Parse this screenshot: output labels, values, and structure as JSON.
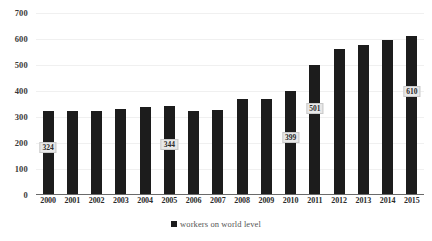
{
  "chart_data": {
    "type": "bar",
    "title": "",
    "subtitle": "",
    "xlabel": "",
    "ylabel": "",
    "categories": [
      "2000",
      "2001",
      "2002",
      "2003",
      "2004",
      "2005",
      "2006",
      "2007",
      "2008",
      "2009",
      "2010",
      "2011",
      "2012",
      "2013",
      "2014",
      "2015"
    ],
    "values": [
      324,
      323,
      323,
      330,
      338,
      344,
      323,
      327,
      370,
      368,
      399,
      501,
      560,
      578,
      598,
      610
    ],
    "point_labels": {
      "2000": "324",
      "2005": "344",
      "2010": "399",
      "2011": "501",
      "2015": "610"
    },
    "ylim": [
      0,
      700
    ],
    "yticks": [
      "0",
      "100",
      "200",
      "300",
      "400",
      "500",
      "600",
      "700"
    ],
    "grid": true,
    "legend": {
      "position": "bottom",
      "entries": [
        {
          "label": "workers on world level",
          "color": "#1c1c1c"
        }
      ]
    },
    "series": [
      {
        "name": "workers on world level",
        "color": "#1c1c1c"
      }
    ],
    "colors": {
      "bar": "#1c1c1c",
      "gridline": "#f0f0f0",
      "axis": "#6a6a6a",
      "tick_text": "#2b2b2b",
      "legend_text": "#555555",
      "label_background": "#e8e8e8",
      "label_border": "#c9c9c9",
      "background": "#ffffff"
    }
  }
}
